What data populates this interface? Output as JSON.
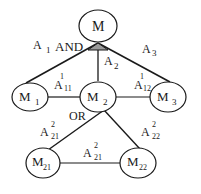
{
  "diagram": {
    "root": {
      "label": "M"
    },
    "and_label": "AND",
    "or_label": "OR",
    "nodes": {
      "m1": {
        "base": "M",
        "sub": "1"
      },
      "m2": {
        "base": "M",
        "sub": "2"
      },
      "m3": {
        "base": "M",
        "sub": "3"
      },
      "m21": {
        "base": "M",
        "sub": "21"
      },
      "m22": {
        "base": "M",
        "sub": "22"
      }
    },
    "edge_labels": {
      "a1": {
        "base": "A",
        "sub": "1"
      },
      "a2": {
        "base": "A",
        "sub": "2"
      },
      "a3": {
        "base": "A",
        "sub": "3"
      },
      "a11": {
        "base": "A",
        "sup": "1",
        "sub": "11"
      },
      "a12": {
        "base": "A",
        "sup": "1",
        "sub": "12"
      },
      "a21_left": {
        "base": "A",
        "sup": "2",
        "sub": "21"
      },
      "a22": {
        "base": "A",
        "sup": "2",
        "sub": "22"
      },
      "a21_bottom": {
        "base": "A",
        "sup": "2",
        "sub": "21"
      }
    },
    "colors": {
      "stroke": "#1a1a1a",
      "and_fill": "#9a9a9a"
    }
  }
}
